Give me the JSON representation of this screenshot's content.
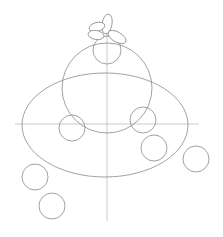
{
  "canvas": {
    "width": 223,
    "height": 237,
    "background": "#ffffff",
    "stroke_color": "#8a8a8a",
    "guide_color": "#b5b5b5"
  },
  "guides": {
    "vertical": {
      "x": 107,
      "y1": 33,
      "y2": 221
    },
    "horizontal": {
      "y": 124,
      "x1": 15,
      "x2": 199
    }
  },
  "shapes": {
    "base_ellipse": {
      "cx": 105,
      "cy": 125,
      "rx": 83,
      "ry": 52
    },
    "body_circle": {
      "cx": 107,
      "cy": 88,
      "r": 45
    },
    "head_circle": {
      "cx": 107,
      "cy": 50,
      "r": 14
    },
    "petals": [
      {
        "cx": 107,
        "cy": 24,
        "rx": 5,
        "ry": 10,
        "rotate": 10
      },
      {
        "cx": 97,
        "cy": 27,
        "rx": 8,
        "ry": 4.5,
        "rotate": -15
      },
      {
        "cx": 96,
        "cy": 35,
        "rx": 8,
        "ry": 4.5,
        "rotate": 10
      },
      {
        "cx": 117,
        "cy": 37,
        "rx": 10,
        "ry": 5,
        "rotate": 30
      }
    ],
    "small_circles": [
      {
        "cx": 72,
        "cy": 128,
        "r": 13
      },
      {
        "cx": 143,
        "cy": 120,
        "r": 13
      },
      {
        "cx": 154,
        "cy": 148,
        "r": 13
      },
      {
        "cx": 196,
        "cy": 159,
        "r": 13
      },
      {
        "cx": 35,
        "cy": 177,
        "r": 13
      },
      {
        "cx": 52,
        "cy": 206,
        "r": 13
      }
    ]
  }
}
